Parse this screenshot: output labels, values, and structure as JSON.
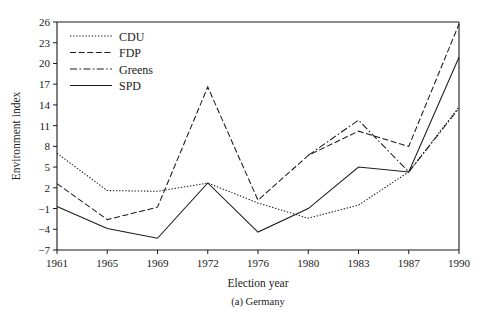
{
  "chart_data": {
    "type": "line",
    "title": "",
    "caption": "(a) Germany",
    "xlabel": "Election year",
    "ylabel": "Environment index",
    "categories": [
      "1961",
      "1965",
      "1969",
      "1972",
      "1976",
      "1980",
      "1983",
      "1987",
      "1990"
    ],
    "yticks": [
      -7,
      -4,
      -1,
      2,
      5,
      8,
      11,
      14,
      17,
      20,
      23,
      26
    ],
    "ylim": [
      -7,
      26
    ],
    "grid": false,
    "legend_position": "top-left",
    "series": [
      {
        "name": "CDU",
        "style": "dotted",
        "values": [
          7.0,
          1.6,
          1.5,
          2.7,
          -0.2,
          -2.4,
          -0.5,
          4.3,
          13.7
        ]
      },
      {
        "name": "FDP",
        "style": "dashed",
        "values": [
          2.6,
          -2.6,
          -0.8,
          16.6,
          0.2,
          6.7,
          10.2,
          8.0,
          25.7
        ]
      },
      {
        "name": "Greens",
        "style": "dash-dot",
        "values": [
          null,
          null,
          null,
          null,
          null,
          6.7,
          11.8,
          4.3,
          13.5
        ]
      },
      {
        "name": "SPD",
        "style": "solid",
        "values": [
          -0.7,
          -3.9,
          -5.3,
          2.7,
          -4.4,
          -1.0,
          5.0,
          4.3,
          20.9
        ]
      }
    ]
  },
  "axes": {
    "ylabel": "Environment index",
    "xlabel": "Election year",
    "caption": "(a) Germany"
  },
  "legend": {
    "items": [
      {
        "label": "CDU"
      },
      {
        "label": "FDP"
      },
      {
        "label": "Greens"
      },
      {
        "label": "SPD"
      }
    ]
  }
}
